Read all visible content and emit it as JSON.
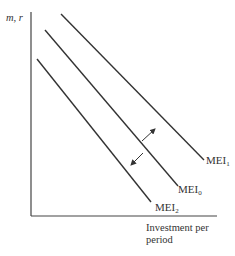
{
  "diagram": {
    "title": "",
    "y_axis_label": "m, r",
    "x_axis_label": "Investment per period",
    "x_axis_label_lines": [
      "Investment per",
      "period"
    ],
    "curves": [
      {
        "id": "MEI1",
        "base": "MEI",
        "subscript": "1",
        "x1": 61,
        "y1": 14,
        "x2": 204,
        "y2": 160
      },
      {
        "id": "MEI0",
        "base": "MEI",
        "subscript": "0",
        "x1": 45,
        "y1": 30,
        "x2": 178,
        "y2": 186
      },
      {
        "id": "MEI2",
        "base": "MEI",
        "subscript": "2",
        "x1": 37,
        "y1": 59,
        "x2": 151,
        "y2": 202
      }
    ],
    "arrows": [
      {
        "direction": "outward",
        "from": "MEI0",
        "to": "MEI1"
      },
      {
        "direction": "inward",
        "from": "MEI0",
        "to": "MEI2"
      }
    ],
    "colors": {
      "line": "#333333",
      "axis": "#444444",
      "text": "#333333",
      "background": "#ffffff"
    }
  }
}
